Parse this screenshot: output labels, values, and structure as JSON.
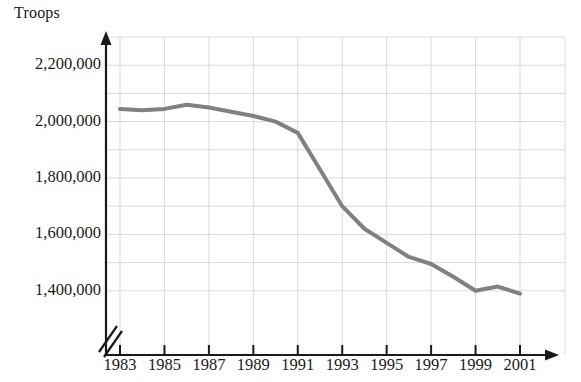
{
  "chart_data": {
    "type": "line",
    "title": "",
    "ylabel": "Troops",
    "xlabel": "",
    "axis_break": true,
    "grid": true,
    "legend": false,
    "line_color": "#808080",
    "axis_color": "#1a1a1a",
    "grid_color": "#d9d9d9",
    "xlim": [
      1983,
      2001
    ],
    "ylim": [
      1300000,
      2300000
    ],
    "y_tick_labels": [
      "2,200,000",
      "2,000,000",
      "1,800,000",
      "1,600,000",
      "1,400,000"
    ],
    "y_ticks": [
      2200000,
      2000000,
      1800000,
      1600000,
      1400000
    ],
    "y_minor_step": 100000,
    "x_tick_labels": [
      "1983",
      "1985",
      "1987",
      "1989",
      "1991",
      "1993",
      "1995",
      "1997",
      "1999",
      "2001"
    ],
    "x_ticks": [
      1983,
      1985,
      1987,
      1989,
      1991,
      1993,
      1995,
      1997,
      1999,
      2001
    ],
    "x": [
      1983,
      1984,
      1985,
      1986,
      1987,
      1988,
      1989,
      1990,
      1991,
      1992,
      1993,
      1994,
      1995,
      1996,
      1997,
      1998,
      1999,
      2000,
      2001
    ],
    "values": [
      2045000,
      2040000,
      2045000,
      2060000,
      2050000,
      2035000,
      2020000,
      2000000,
      1960000,
      1830000,
      1700000,
      1620000,
      1570000,
      1520000,
      1495000,
      1450000,
      1400000,
      1415000,
      1390000
    ],
    "series": [
      {
        "name": "Troops",
        "values": [
          2045000,
          2040000,
          2045000,
          2060000,
          2050000,
          2035000,
          2020000,
          2000000,
          1960000,
          1830000,
          1700000,
          1620000,
          1570000,
          1520000,
          1495000,
          1450000,
          1400000,
          1415000,
          1390000
        ]
      }
    ]
  }
}
